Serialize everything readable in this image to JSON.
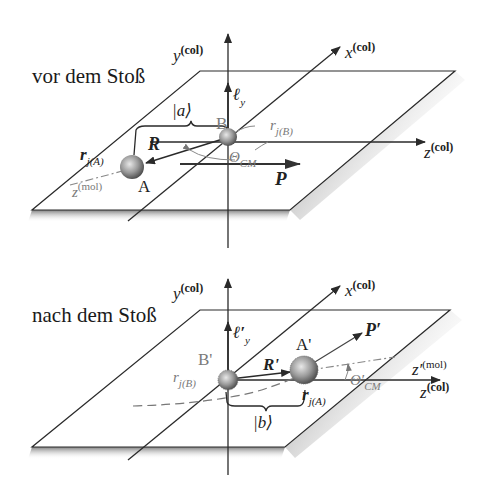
{
  "figure": {
    "panels": [
      {
        "id": "before",
        "title": "vor dem Stoß",
        "axes": {
          "y": {
            "base": "y",
            "sup": "(col)"
          },
          "x": {
            "base": "x",
            "sup": "(col)"
          },
          "z": {
            "base": "z",
            "sup": "(col)"
          }
        },
        "angular_momentum": {
          "base": "ℓ",
          "sub": "y"
        },
        "state": "|a⟩",
        "atom_a": {
          "label": "A"
        },
        "atom_b": {
          "label": "B"
        },
        "separation": {
          "label": "R"
        },
        "momentum": {
          "label": "P"
        },
        "angle": {
          "base": "Θ",
          "sub": "CM"
        },
        "electron_a": {
          "base": "r",
          "sub": "j(A)"
        },
        "electron_b": {
          "base": "r",
          "sub": "j(B)"
        },
        "mol_axis": {
          "base": "z",
          "sup": "(mol)"
        }
      },
      {
        "id": "after",
        "title": "nach dem Stoß",
        "axes": {
          "y": {
            "base": "y",
            "sup": "(col)"
          },
          "x": {
            "base": "x",
            "sup": "(col)"
          },
          "z": {
            "base": "z",
            "sup": "(col)"
          }
        },
        "angular_momentum": {
          "base": "ℓ′",
          "sub": "y"
        },
        "state": "|b⟩",
        "atom_a": {
          "label": "A'"
        },
        "atom_b": {
          "label": "B'"
        },
        "separation": {
          "label": "R'"
        },
        "momentum": {
          "label": "P′"
        },
        "angle": {
          "base": "Θ′",
          "sub": "CM"
        },
        "electron_a": {
          "base": "r",
          "sub": "j(A)"
        },
        "electron_b": {
          "base": "r",
          "sub": "j(B)"
        },
        "mol_axis": {
          "base": "z′",
          "sup": "(mol)"
        }
      }
    ]
  },
  "colors": {
    "line": "#2a2a2a",
    "gray_label": "#7a7a7a",
    "sphere_light": "#e6e6e6",
    "sphere_dark": "#555555"
  }
}
